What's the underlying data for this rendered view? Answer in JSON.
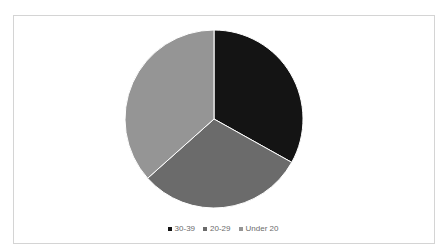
{
  "chart_data": {
    "type": "pie",
    "title": "",
    "categories": [
      "30-39",
      "20-29",
      "Under 20"
    ],
    "values": [
      33.1,
      30.3,
      36.6
    ],
    "unit": "percent (estimated from slice angles)",
    "colors": [
      "#141414",
      "#6b6b6b",
      "#959595"
    ],
    "start_angle_deg": 0,
    "direction": "clockwise",
    "legend_position": "bottom",
    "data_labels": false
  },
  "legend": {
    "items": [
      {
        "label": "30-39",
        "color": "#141414"
      },
      {
        "label": "20-29",
        "color": "#6b6b6b"
      },
      {
        "label": "Under 20",
        "color": "#959595"
      }
    ]
  }
}
